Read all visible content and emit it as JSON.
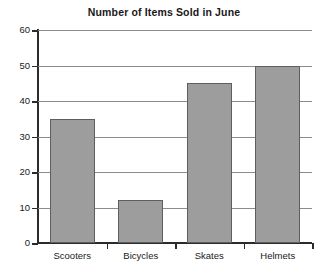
{
  "chart_data": {
    "type": "bar",
    "title": "Number of Items Sold in June",
    "xlabel": "",
    "ylabel": "",
    "categories": [
      "Scooters",
      "Bicycles",
      "Skates",
      "Helmets"
    ],
    "values": [
      35,
      12,
      45,
      50
    ],
    "ylim": [
      0,
      60
    ],
    "ytick_labels": [
      "0",
      "10",
      "20",
      "30",
      "40",
      "50",
      "60"
    ],
    "ytick_values": [
      0,
      10,
      20,
      30,
      40,
      50,
      60
    ],
    "grid": "horizontal",
    "legend": "none",
    "bar_color": "#9d9d9d",
    "bar_edge_color": "#5e5e5e",
    "axis_color": "#2b2b2b",
    "gridline_color": "#8c8c8c",
    "background_color": "#ffffff"
  }
}
